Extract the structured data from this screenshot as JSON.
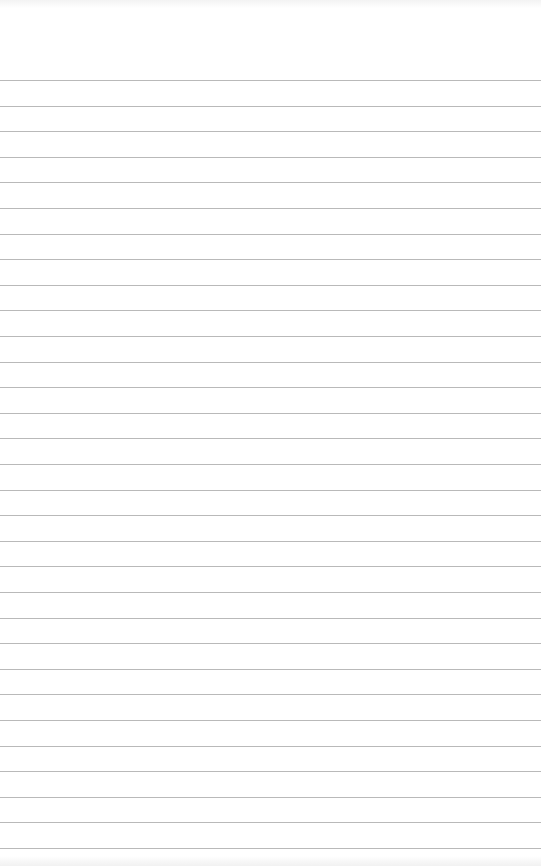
{
  "sheet": {
    "type": "lined-paper",
    "background": "#ffffff",
    "rule_color": "#b9b9b9",
    "first_rule_y": 80,
    "rule_spacing": 25.6,
    "rule_count": 31
  }
}
